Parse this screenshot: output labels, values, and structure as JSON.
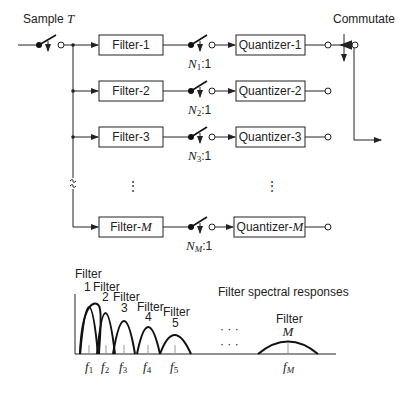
{
  "diagram": {
    "input_label": "Sample ",
    "input_label_var": "T",
    "commutate_label": "Commutate",
    "ellipsis": "⋮",
    "branches": [
      {
        "filter": "Filter-1",
        "quantizer": "Quantizer-1",
        "ratio_var": "N",
        "ratio_sub": "1",
        "ratio_suffix": ":1"
      },
      {
        "filter": "Filter-2",
        "quantizer": "Quantizer-2",
        "ratio_var": "N",
        "ratio_sub": "2",
        "ratio_suffix": ":1"
      },
      {
        "filter": "Filter-3",
        "quantizer": "Quantizer-3",
        "ratio_var": "N",
        "ratio_sub": "3",
        "ratio_suffix": ":1"
      },
      {
        "filter": "Filter-",
        "filter_var": "M",
        "quantizer": "Quantizer-",
        "quantizer_var": "M",
        "ratio_var": "N",
        "ratio_sub": "M",
        "ratio_suffix": ":1"
      }
    ]
  },
  "spectrum": {
    "title": "Filter spectral responses",
    "filter_word": "Filter",
    "filters": [
      {
        "num": "1",
        "freq_var": "f",
        "freq_sub": "1"
      },
      {
        "num": "2",
        "freq_var": "f",
        "freq_sub": "2"
      },
      {
        "num": "3",
        "freq_var": "f",
        "freq_sub": "3"
      },
      {
        "num": "4",
        "freq_var": "f",
        "freq_sub": "4"
      },
      {
        "num": "5",
        "freq_var": "f",
        "freq_sub": "5"
      },
      {
        "num": "M",
        "freq_var": "f",
        "freq_sub": "M"
      }
    ],
    "dots": "· · ·"
  }
}
